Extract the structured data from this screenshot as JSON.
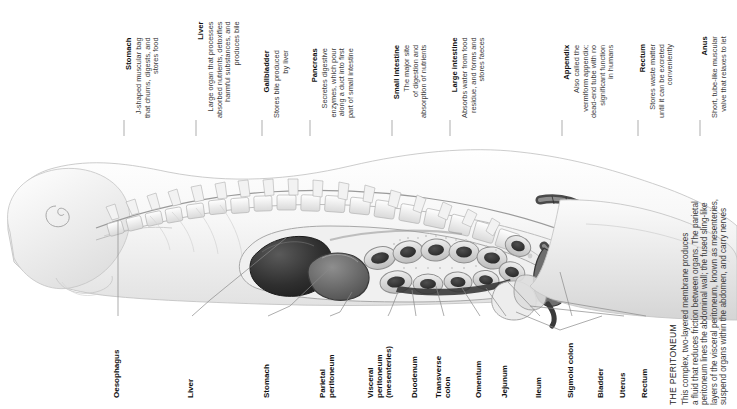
{
  "figure": {
    "type": "anatomical-illustration",
    "style": "grayscale medical illustration"
  },
  "top_callouts": [
    {
      "title": "Stomach",
      "lines": [
        "J-shaped muscular bag",
        "that churns, digests, and",
        "stores food"
      ],
      "x": 124
    },
    {
      "title": "Liver",
      "lines": [
        "Large organ that processes",
        "absorbed nutrients, detoxifies",
        "harmful substances, and",
        "produces bile"
      ],
      "x": 196
    },
    {
      "title": "Gallbladder",
      "lines": [
        "Stores bile produced",
        "by liver"
      ],
      "x": 262
    },
    {
      "title": "Pancreas",
      "lines": [
        "Secretes digestive",
        "enzymes, which pour",
        "along a duct into first",
        "part of small intestine"
      ],
      "x": 310
    },
    {
      "title": "Small intestine",
      "lines": [
        "The major site",
        "of digestion and",
        "absorption of nutrients"
      ],
      "x": 392
    },
    {
      "title": "Large intestine",
      "lines": [
        "Absorbs water from food",
        "residue, and forms and",
        "stores faeces"
      ],
      "x": 450
    },
    {
      "title": "Appendix",
      "lines": [
        "Also called the",
        "vermiform appendix;",
        "dead-end tube with no",
        "significant function",
        "in humans"
      ],
      "x": 562
    },
    {
      "title": "Rectum",
      "lines": [
        "Stores waste matter",
        "until it can be excreted",
        "conveniently"
      ],
      "x": 638
    },
    {
      "title": "Anus",
      "lines": [
        "Short, tube-like muscular",
        "valve that relaxes to let"
      ],
      "x": 700
    }
  ],
  "bottom_labels": [
    {
      "lines": [
        "Oesophagus"
      ],
      "x": 112,
      "y": 398,
      "lead_x": 118,
      "lead_top": 218
    },
    {
      "lines": [
        "Liver"
      ],
      "x": 186,
      "y": 398,
      "lead_x": 192,
      "lead_top": 278
    },
    {
      "lines": [
        "Stomach"
      ],
      "x": 262,
      "y": 398,
      "lead_x": 268,
      "lead_top": 298
    },
    {
      "lines": [
        "Parietal",
        "peritoneum"
      ],
      "x": 318,
      "y": 398,
      "lead_x": 330,
      "lead_top": 300
    },
    {
      "lines": [
        "Visceral",
        "peritoneum",
        "(mesenteries)"
      ],
      "x": 366,
      "y": 398,
      "lead_x": 388,
      "lead_top": 290
    },
    {
      "lines": [
        "Duodenum"
      ],
      "x": 410,
      "y": 398,
      "lead_x": 416,
      "lead_top": 288
    },
    {
      "lines": [
        "Transverse",
        "colon"
      ],
      "x": 434,
      "y": 398,
      "lead_x": 444,
      "lead_top": 282
    },
    {
      "lines": [
        "Omentum"
      ],
      "x": 474,
      "y": 398,
      "lead_x": 480,
      "lead_top": 284
    },
    {
      "lines": [
        "Jejunum"
      ],
      "x": 500,
      "y": 398,
      "lead_x": 506,
      "lead_top": 280
    },
    {
      "lines": [
        "Ileum"
      ],
      "x": 534,
      "y": 398,
      "lead_x": 540,
      "lead_top": 272
    },
    {
      "lines": [
        "Sigmoid colon"
      ],
      "x": 566,
      "y": 398,
      "lead_x": 572,
      "lead_top": 268
    },
    {
      "lines": [
        "Bladder"
      ],
      "x": 596,
      "y": 398,
      "lead_x": 602,
      "lead_top": 276
    },
    {
      "lines": [
        "Uterus"
      ],
      "x": 618,
      "y": 398,
      "lead_x": 624,
      "lead_top": 276
    },
    {
      "lines": [
        "Rectum"
      ],
      "x": 640,
      "y": 398,
      "lead_x": 646,
      "lead_top": 276
    }
  ],
  "peritoneum_note": {
    "title": "THE PERITONEUM",
    "lines": [
      "This complex, two-layered membrane produces",
      "a fluid that reduces friction between organs. The parietal",
      "peritoneum lines the abdominal wall; the fused sling-like",
      "layers of the visceral peritoneum, known as mesenteries,",
      "suspend organs within the abdomen, and carry nerves"
    ]
  },
  "colors": {
    "text": "#1a1a1a",
    "body_text": "#3a3a3a",
    "leader_line": "#8a8a8a",
    "illustration_dark": "#2b2b2b",
    "illustration_mid": "#8d8d8d",
    "illustration_light": "#d8d8d8"
  }
}
